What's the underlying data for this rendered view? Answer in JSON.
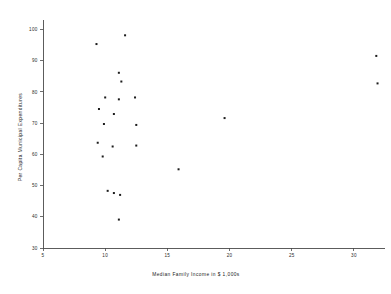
{
  "chart_data": {
    "type": "scatter",
    "title": "",
    "xlabel": "Median Family Income in $ 1,000s",
    "ylabel": "Per Capita Municipal Expenditures",
    "xlim": [
      5,
      32.5
    ],
    "ylim": [
      30,
      103
    ],
    "xticks": [
      5,
      10,
      15,
      20,
      25,
      30
    ],
    "yticks": [
      30,
      40,
      50,
      60,
      70,
      80,
      90,
      100
    ],
    "xtick_labels": [
      "5",
      "10",
      "15",
      "20",
      "25",
      "30"
    ],
    "ytick_labels": [
      "30",
      "40",
      "50",
      "60",
      "70",
      "80",
      "90",
      "100"
    ],
    "grid": false,
    "legend": "none",
    "marker": "square",
    "marker_color": "#1c1c1c",
    "points": [
      {
        "x": 9.3,
        "y": 95.3
      },
      {
        "x": 11.6,
        "y": 98.1
      },
      {
        "x": 11.1,
        "y": 86.1
      },
      {
        "x": 11.3,
        "y": 83.3
      },
      {
        "x": 10.0,
        "y": 78.2
      },
      {
        "x": 11.1,
        "y": 77.6
      },
      {
        "x": 12.4,
        "y": 78.2
      },
      {
        "x": 9.5,
        "y": 74.5
      },
      {
        "x": 10.7,
        "y": 72.9
      },
      {
        "x": 9.9,
        "y": 69.7
      },
      {
        "x": 12.5,
        "y": 69.4
      },
      {
        "x": 9.4,
        "y": 63.7
      },
      {
        "x": 10.6,
        "y": 62.5
      },
      {
        "x": 12.5,
        "y": 62.8
      },
      {
        "x": 9.8,
        "y": 59.3
      },
      {
        "x": 10.2,
        "y": 48.3
      },
      {
        "x": 10.7,
        "y": 47.6
      },
      {
        "x": 11.2,
        "y": 47.0
      },
      {
        "x": 11.1,
        "y": 39.1
      },
      {
        "x": 19.6,
        "y": 71.6
      },
      {
        "x": 15.9,
        "y": 55.2
      },
      {
        "x": 31.8,
        "y": 91.5
      },
      {
        "x": 31.9,
        "y": 82.7
      }
    ]
  }
}
